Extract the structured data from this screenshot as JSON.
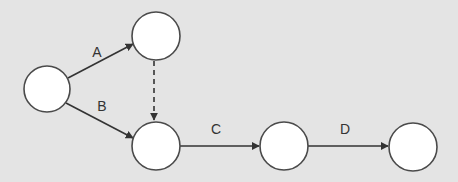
{
  "diagram": {
    "type": "activity-on-arrow network",
    "background": "#e4e4e4",
    "nodes": [
      {
        "id": "n1",
        "cx": 47,
        "cy": 89,
        "r": 23
      },
      {
        "id": "n2",
        "cx": 156,
        "cy": 36,
        "r": 24
      },
      {
        "id": "n3",
        "cx": 156,
        "cy": 146,
        "r": 24
      },
      {
        "id": "n4",
        "cx": 284,
        "cy": 146,
        "r": 24
      },
      {
        "id": "n5",
        "cx": 413,
        "cy": 147,
        "r": 24
      }
    ],
    "edges": [
      {
        "id": "A",
        "from": "n1",
        "to": "n2",
        "label": "A",
        "style": "solid"
      },
      {
        "id": "B",
        "from": "n1",
        "to": "n3",
        "label": "B",
        "style": "solid"
      },
      {
        "id": "dummy",
        "from": "n2",
        "to": "n3",
        "label": "",
        "style": "dashed"
      },
      {
        "id": "C",
        "from": "n3",
        "to": "n4",
        "label": "C",
        "style": "solid"
      },
      {
        "id": "D",
        "from": "n4",
        "to": "n5",
        "label": "D",
        "style": "solid"
      }
    ],
    "labels": {
      "A": "A",
      "B": "B",
      "C": "C",
      "D": "D"
    }
  }
}
